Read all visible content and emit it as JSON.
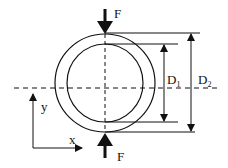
{
  "diagram": {
    "type": "ring-compression-schematic",
    "colors": {
      "stroke": "#111111",
      "background": "#ffffff"
    },
    "force_top": {
      "label": "F",
      "direction": "down"
    },
    "force_bottom": {
      "label": "F",
      "direction": "up"
    },
    "inner_diameter": {
      "label": "D",
      "subscript": "1"
    },
    "outer_diameter": {
      "label": "D",
      "subscript": "2"
    },
    "axes": {
      "x_label": "x",
      "y_label": "y"
    }
  }
}
